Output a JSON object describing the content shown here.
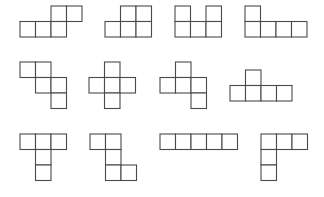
{
  "cell_size": 15.5,
  "stroke_color": "#4a4a4a",
  "background": "#ffffff",
  "nets": [
    {
      "id": 1,
      "origin": [
        20,
        6
      ],
      "cells": [
        [
          2,
          0
        ],
        [
          3,
          0
        ],
        [
          0,
          1
        ],
        [
          1,
          1
        ],
        [
          2,
          1
        ]
      ]
    },
    {
      "id": 2,
      "origin": [
        105,
        6
      ],
      "cells": [
        [
          1,
          0
        ],
        [
          2,
          0
        ],
        [
          0,
          1
        ],
        [
          1,
          1
        ],
        [
          2,
          1
        ]
      ]
    },
    {
      "id": 3,
      "origin": [
        175,
        6
      ],
      "cells": [
        [
          0,
          0
        ],
        [
          2,
          0
        ],
        [
          0,
          1
        ],
        [
          1,
          1
        ],
        [
          2,
          1
        ]
      ]
    },
    {
      "id": 4,
      "origin": [
        245,
        6
      ],
      "cells": [
        [
          0,
          0
        ],
        [
          0,
          1
        ],
        [
          1,
          1
        ],
        [
          2,
          1
        ],
        [
          3,
          1
        ]
      ]
    },
    {
      "id": 5,
      "origin": [
        20,
        62
      ],
      "cells": [
        [
          0,
          0
        ],
        [
          1,
          0
        ],
        [
          1,
          1
        ],
        [
          2,
          1
        ],
        [
          2,
          2
        ]
      ]
    },
    {
      "id": 6,
      "origin": [
        89,
        62
      ],
      "cells": [
        [
          1,
          0
        ],
        [
          0,
          1
        ],
        [
          1,
          1
        ],
        [
          2,
          1
        ],
        [
          1,
          2
        ]
      ]
    },
    {
      "id": 7,
      "origin": [
        160,
        62
      ],
      "cells": [
        [
          1,
          0
        ],
        [
          0,
          1
        ],
        [
          1,
          1
        ],
        [
          2,
          1
        ],
        [
          2,
          2
        ]
      ]
    },
    {
      "id": 8,
      "origin": [
        230,
        70
      ],
      "cells": [
        [
          1,
          0
        ],
        [
          0,
          1
        ],
        [
          1,
          1
        ],
        [
          2,
          1
        ],
        [
          3,
          1
        ]
      ]
    },
    {
      "id": 9,
      "origin": [
        20,
        134
      ],
      "cells": [
        [
          0,
          0
        ],
        [
          1,
          0
        ],
        [
          2,
          0
        ],
        [
          1,
          1
        ],
        [
          1,
          2
        ]
      ]
    },
    {
      "id": 10,
      "origin": [
        90,
        134
      ],
      "cells": [
        [
          0,
          0
        ],
        [
          1,
          0
        ],
        [
          1,
          1
        ],
        [
          1,
          2
        ],
        [
          2,
          2
        ]
      ]
    },
    {
      "id": 11,
      "origin": [
        160,
        134
      ],
      "cells": [
        [
          0,
          0
        ],
        [
          1,
          0
        ],
        [
          2,
          0
        ],
        [
          3,
          0
        ],
        [
          4,
          0
        ]
      ]
    },
    {
      "id": 12,
      "origin": [
        261,
        134
      ],
      "cells": [
        [
          0,
          0
        ],
        [
          1,
          0
        ],
        [
          2,
          0
        ],
        [
          0,
          1
        ],
        [
          0,
          2
        ]
      ]
    }
  ]
}
